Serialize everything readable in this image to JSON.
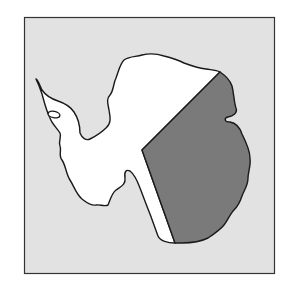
{
  "map": {
    "subject": "Antarctica outline map",
    "frame": {
      "x": 24,
      "y": 17,
      "width": 251,
      "height": 257
    },
    "colors": {
      "background": "#ffffff",
      "ocean": "#e2e2e2",
      "land": "#ffffff",
      "shaded_region": "#7a7a7a",
      "outline": "#1a1a1a"
    },
    "regions": [
      {
        "name": "West Antarctica (unshaded)",
        "fill": "land"
      },
      {
        "name": "East Antarctica (shaded)",
        "fill": "shaded_region"
      }
    ],
    "features": [
      "Antarctic Peninsula",
      "offshore island",
      "dividing line between shaded and unshaded regions"
    ]
  }
}
